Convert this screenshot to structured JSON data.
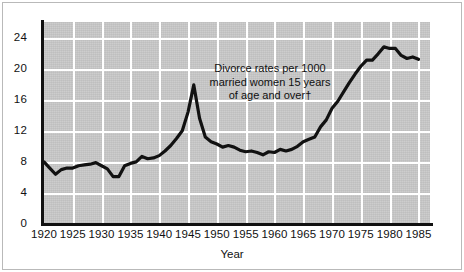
{
  "chart_data": {
    "type": "line",
    "title": "",
    "subtitle": "",
    "annotation": "Divorce rates per 1000\nmarried women 15 years\nof age and over†",
    "xlabel": "Year",
    "ylabel": "",
    "xlim": [
      1920,
      1987
    ],
    "ylim": [
      0,
      26
    ],
    "grid": true,
    "grid_color": "#ffffff",
    "plot_background": "#c9c9c9",
    "line_color": "#111111",
    "legend": [],
    "legend_position": "none",
    "xticks": [
      1920,
      1925,
      1930,
      1935,
      1940,
      1945,
      1950,
      1955,
      1960,
      1965,
      1970,
      1975,
      1980,
      1985
    ],
    "xtick_labels": [
      "1920",
      "1925",
      "1930",
      "1935",
      "1940",
      "1945",
      "1950",
      "1955",
      "1960",
      "1965",
      "1970",
      "1975",
      "1980",
      "1985"
    ],
    "yticks": [
      0,
      4,
      8,
      12,
      16,
      20,
      24
    ],
    "ytick_labels": [
      "0",
      "4",
      "8",
      "12",
      "16",
      "20",
      "24"
    ],
    "series": [
      {
        "name": "Divorce rate per 1000 married women 15 and over",
        "x": [
          1920,
          1921,
          1922,
          1923,
          1924,
          1925,
          1926,
          1927,
          1928,
          1929,
          1930,
          1931,
          1932,
          1933,
          1934,
          1935,
          1936,
          1937,
          1938,
          1939,
          1940,
          1941,
          1942,
          1943,
          1944,
          1945,
          1946,
          1947,
          1948,
          1949,
          1950,
          1951,
          1952,
          1953,
          1954,
          1955,
          1956,
          1957,
          1958,
          1959,
          1960,
          1961,
          1962,
          1963,
          1964,
          1965,
          1966,
          1967,
          1968,
          1969,
          1970,
          1971,
          1972,
          1973,
          1974,
          1975,
          1976,
          1977,
          1978,
          1979,
          1980,
          1981,
          1982,
          1983,
          1984,
          1985
        ],
        "y": [
          8.0,
          7.2,
          6.4,
          7.0,
          7.2,
          7.2,
          7.5,
          7.6,
          7.7,
          7.9,
          7.5,
          7.1,
          6.1,
          6.1,
          7.5,
          7.8,
          8.0,
          8.7,
          8.4,
          8.5,
          8.8,
          9.4,
          10.1,
          11.0,
          12.0,
          14.4,
          17.9,
          13.6,
          11.2,
          10.6,
          10.3,
          9.9,
          10.1,
          9.9,
          9.5,
          9.3,
          9.4,
          9.2,
          8.9,
          9.3,
          9.2,
          9.6,
          9.4,
          9.6,
          10.0,
          10.6,
          10.9,
          11.2,
          12.5,
          13.4,
          14.9,
          15.8,
          17.0,
          18.2,
          19.3,
          20.3,
          21.1,
          21.1,
          21.9,
          22.8,
          22.6,
          22.6,
          21.7,
          21.3,
          21.5,
          21.2
        ]
      }
    ]
  },
  "axes": {
    "x_title": "Year"
  }
}
